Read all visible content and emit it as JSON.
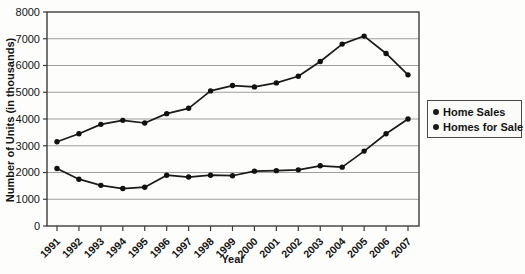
{
  "colors": {
    "page_bg": "#fdfdfc",
    "plot_bg": "#fdfdfc",
    "grid": "#9e9e9e",
    "axis": "#3c3c3c",
    "line": "#1a1a1a",
    "marker": "#111111",
    "text": "#141414",
    "legend_bg": "#fbfbfa",
    "legend_border": "#4a4a4a"
  },
  "chart_data": {
    "type": "line",
    "title": "",
    "xlabel": "Year",
    "ylabel": "Number of Units (in thousands)",
    "categories": [
      "1991",
      "1992",
      "1993",
      "1994",
      "1995",
      "1996",
      "1997",
      "1998",
      "1999",
      "2000",
      "2001",
      "2002",
      "2003",
      "2004",
      "2005",
      "2006",
      "2007"
    ],
    "ylim": [
      0,
      8000
    ],
    "ytick_interval": 1000,
    "ytick_labels": [
      "0",
      "1000",
      "2000",
      "3000",
      "4000",
      "5000",
      "6000",
      "7000",
      "8000"
    ],
    "grid": "horizontal",
    "legend_position": "right-middle",
    "series": [
      {
        "name": "Home Sales",
        "marker": "circle",
        "values": [
          3150,
          3450,
          3800,
          3950,
          3850,
          4200,
          4400,
          5050,
          5250,
          5200,
          5350,
          5600,
          6150,
          6800,
          7100,
          6450,
          5650
        ]
      },
      {
        "name": "Homes for Sale",
        "marker": "circle",
        "values": [
          2150,
          1750,
          1520,
          1400,
          1450,
          1900,
          1830,
          1900,
          1880,
          2050,
          2070,
          2100,
          2250,
          2200,
          2800,
          3450,
          4000
        ]
      }
    ]
  }
}
